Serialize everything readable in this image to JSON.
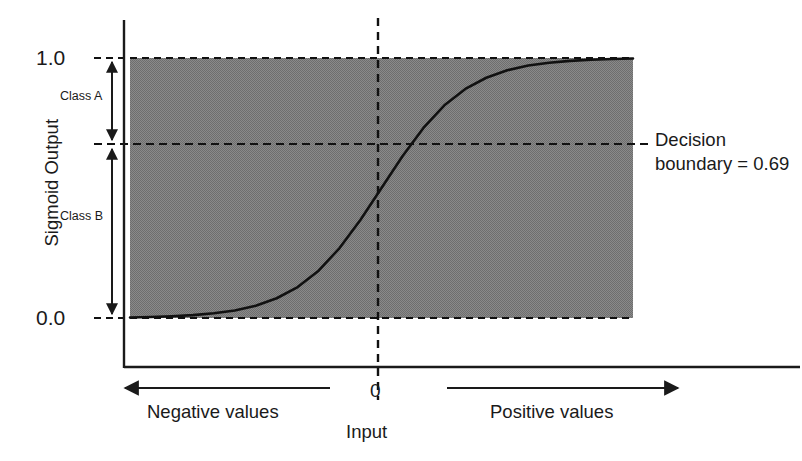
{
  "chart_data": {
    "type": "line",
    "title": "",
    "subtitle": "",
    "xlabel": "Input",
    "ylabel": "Sigmoid Output",
    "xlim": [
      -6,
      6
    ],
    "ylim": [
      0.0,
      1.0
    ],
    "grid": false,
    "legend_position": "none",
    "x_tick_labels": [
      "0"
    ],
    "x_ticks": [
      0
    ],
    "y_tick_labels": [
      "0.0",
      "1.0"
    ],
    "y_ticks": [
      0.0,
      1.0
    ],
    "series": [
      {
        "name": "Sigmoid",
        "formula": "1 / (1 + exp(-x))",
        "x": [
          -6.0,
          -5.5,
          -5.0,
          -4.5,
          -4.0,
          -3.5,
          -3.0,
          -2.5,
          -2.0,
          -1.5,
          -1.0,
          -0.5,
          0.0,
          0.5,
          1.0,
          1.5,
          2.0,
          2.5,
          3.0,
          3.5,
          4.0,
          4.5,
          5.0,
          5.5,
          6.0
        ],
        "values": [
          0.002,
          0.004,
          0.007,
          0.011,
          0.018,
          0.029,
          0.047,
          0.076,
          0.119,
          0.182,
          0.269,
          0.378,
          0.5,
          0.622,
          0.731,
          0.818,
          0.881,
          0.924,
          0.953,
          0.971,
          0.982,
          0.989,
          0.993,
          0.996,
          0.998
        ]
      }
    ],
    "annotations": [
      {
        "name": "decision-boundary",
        "label": "Decision boundary = 0.69",
        "y_value": 0.69,
        "style": "dashed-horizontal"
      },
      {
        "name": "upper-asymptote",
        "label": "1.0",
        "y_value": 1.0,
        "style": "dashed-horizontal"
      },
      {
        "name": "lower-asymptote",
        "label": "0.0",
        "y_value": 0.0,
        "style": "dashed-horizontal"
      },
      {
        "name": "zero-input",
        "label": "0",
        "x_value": 0,
        "style": "dashed-vertical"
      },
      {
        "name": "class-a-range",
        "label": "Class A",
        "from_y": 0.69,
        "to_y": 1.0
      },
      {
        "name": "class-b-range",
        "label": "Class B",
        "from_y": 0.0,
        "to_y": 0.69
      },
      {
        "name": "negative-direction",
        "label": "Negative values",
        "direction": "left"
      },
      {
        "name": "positive-direction",
        "label": "Positive values",
        "direction": "right"
      }
    ],
    "shaded_region": {
      "label": "sigmoid output band",
      "y_from": 0.0,
      "y_to": 1.0,
      "color": "#808080"
    },
    "colors": {
      "curve": "#111111",
      "axis": "#1a1a1a",
      "shading": "#808080",
      "text": "#1a1a1a",
      "background": "#ffffff"
    }
  },
  "axes": {
    "y_title": "Sigmoid Output",
    "y_tick_top": "1.0",
    "y_tick_bottom": "0.0",
    "x_title": "Input",
    "x_tick_zero": "0"
  },
  "labels": {
    "class_a": "Class A",
    "class_b": "Class B",
    "negative_values": "Negative values",
    "positive_values": "Positive values",
    "decision_line_1": "Decision",
    "decision_line_2": "boundary = 0.69"
  }
}
